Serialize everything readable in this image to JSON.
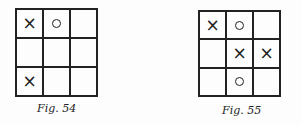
{
  "figures": [
    {
      "caption": "Fig. 54",
      "cells": [
        "X",
        "O",
        "",
        "",
        "",
        "",
        "X",
        "",
        ""
      ]
    },
    {
      "caption": "Fig. 55",
      "cells": [
        "X",
        "O",
        "",
        "",
        "X",
        "X",
        "",
        "O",
        ""
      ]
    }
  ]
}
